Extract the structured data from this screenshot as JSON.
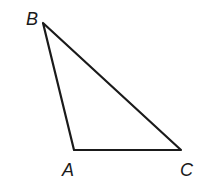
{
  "diagram": {
    "type": "triangle",
    "stroke_color": "#1a1a1a",
    "vertices": [
      {
        "label": "B",
        "x": 43,
        "y": 23,
        "label_x": 26,
        "label_y": 25
      },
      {
        "label": "A",
        "x": 74,
        "y": 150,
        "label_x": 62,
        "label_y": 176
      },
      {
        "label": "C",
        "x": 181,
        "y": 150,
        "label_x": 180,
        "label_y": 176
      }
    ],
    "edges": [
      [
        "B",
        "A"
      ],
      [
        "A",
        "C"
      ],
      [
        "C",
        "B"
      ]
    ]
  }
}
